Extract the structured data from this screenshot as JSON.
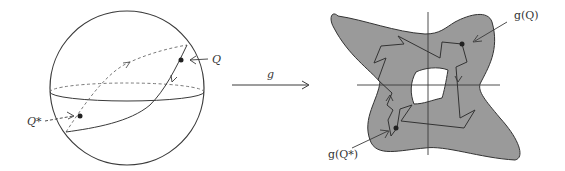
{
  "figure": {
    "type": "mapping-diagram",
    "colors": {
      "stroke": "#3a3a3a",
      "dashed": "#6a6a6a",
      "shape_fill": "#9a9a9a",
      "hole_fill": "#ffffff",
      "background": "#ffffff"
    },
    "sphere": {
      "labels": {
        "q": "Q",
        "q_star": "Q*"
      }
    },
    "map_arrow": {
      "label": "g"
    },
    "image_region": {
      "labels": {
        "g_q": "g(Q)",
        "g_q_star": "g(Q*)"
      }
    }
  }
}
